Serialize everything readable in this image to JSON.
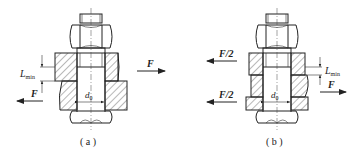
{
  "figures": [
    {
      "id": "a",
      "caption": "( a )",
      "type": "single-shear reamed bolt joint",
      "labels": {
        "force_right": "F",
        "force_left": "F",
        "length_main": "L",
        "length_sub": "min",
        "diameter_main": "d",
        "diameter_sub": "0"
      }
    },
    {
      "id": "b",
      "caption": "( b )",
      "type": "double-shear reamed bolt joint",
      "labels": {
        "force_left_top": "F/2",
        "force_left_bottom": "F/2",
        "force_right": "F",
        "length_main": "L",
        "length_sub": "min",
        "diameter_main": "d",
        "diameter_sub": "0"
      }
    }
  ],
  "colors": {
    "line": "#222222",
    "background": "#ffffff"
  }
}
